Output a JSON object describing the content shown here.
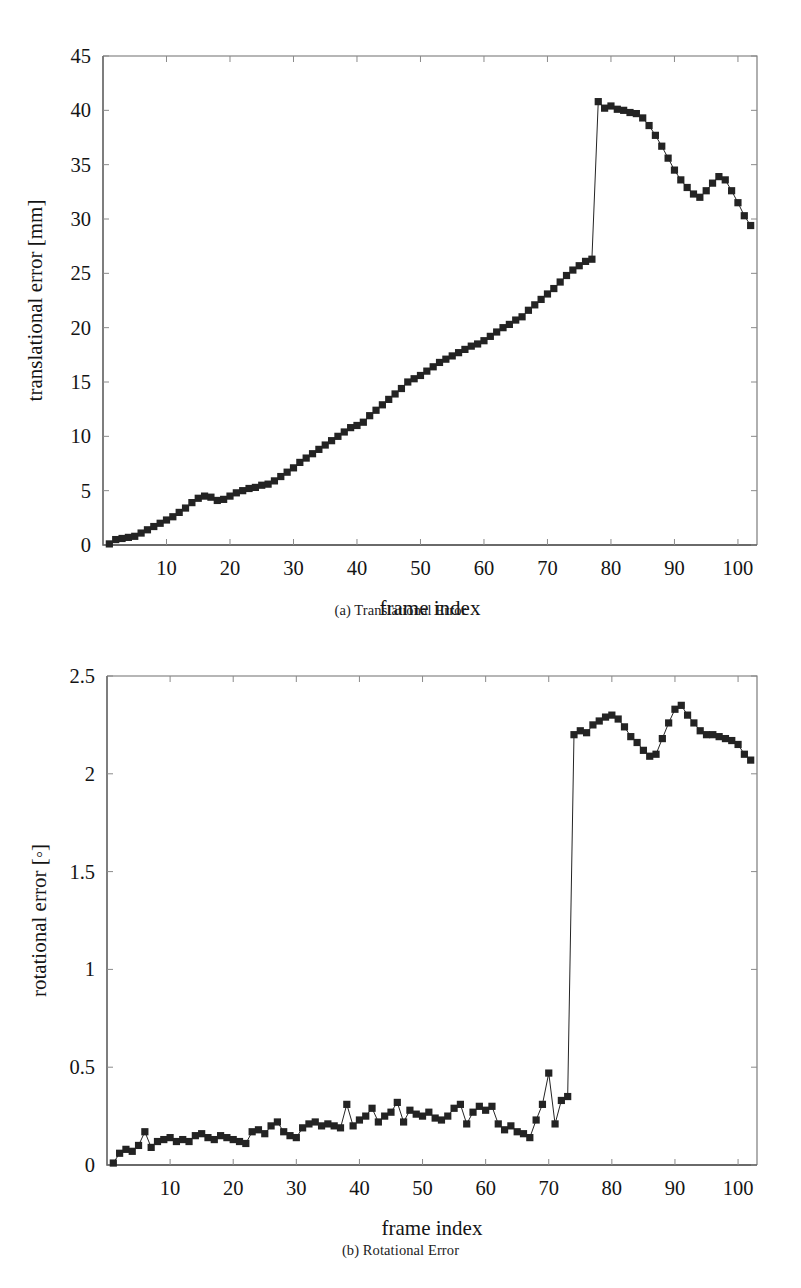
{
  "figure": {
    "panels": [
      {
        "id": "a",
        "caption": "(a) Translational Error"
      },
      {
        "id": "b",
        "caption": "(b) Rotational Error"
      }
    ]
  },
  "chart_data": [
    {
      "type": "line",
      "panel": "a",
      "title": "(a) Translational Error",
      "xlabel": "frame index",
      "ylabel": "translational error [mm]",
      "xlim": [
        0,
        103
      ],
      "ylim": [
        0,
        45
      ],
      "xticks": [
        10,
        20,
        30,
        40,
        50,
        60,
        70,
        80,
        90,
        100
      ],
      "xtick_labels": [
        "10",
        "20",
        "30",
        "40",
        "50",
        "60",
        "70",
        "80",
        "90",
        "100"
      ],
      "yticks": [
        0,
        5,
        10,
        15,
        20,
        25,
        30,
        35,
        40,
        45
      ],
      "ytick_labels": [
        "0",
        "5",
        "10",
        "15",
        "20",
        "25",
        "30",
        "35",
        "40",
        "45"
      ],
      "grid": false,
      "legend": "none",
      "marker": "square",
      "x": [
        1,
        2,
        3,
        4,
        5,
        6,
        7,
        8,
        9,
        10,
        11,
        12,
        13,
        14,
        15,
        16,
        17,
        18,
        19,
        20,
        21,
        22,
        23,
        24,
        25,
        26,
        27,
        28,
        29,
        30,
        31,
        32,
        33,
        34,
        35,
        36,
        37,
        38,
        39,
        40,
        41,
        42,
        43,
        44,
        45,
        46,
        47,
        48,
        49,
        50,
        51,
        52,
        53,
        54,
        55,
        56,
        57,
        58,
        59,
        60,
        61,
        62,
        63,
        64,
        65,
        66,
        67,
        68,
        69,
        70,
        71,
        72,
        73,
        74,
        75,
        76,
        77,
        78,
        79,
        80,
        81,
        82,
        83,
        84,
        85,
        86,
        87,
        88,
        89,
        90,
        91,
        92,
        93,
        94,
        95,
        96,
        97,
        98,
        99,
        100,
        101,
        102
      ],
      "values": [
        0.1,
        0.5,
        0.6,
        0.7,
        0.8,
        1.1,
        1.4,
        1.7,
        2.0,
        2.3,
        2.6,
        3.0,
        3.4,
        3.9,
        4.3,
        4.5,
        4.4,
        4.1,
        4.2,
        4.5,
        4.8,
        5.0,
        5.2,
        5.3,
        5.5,
        5.6,
        5.9,
        6.3,
        6.7,
        7.1,
        7.6,
        8.0,
        8.4,
        8.8,
        9.2,
        9.6,
        10.0,
        10.4,
        10.8,
        11.0,
        11.3,
        11.9,
        12.4,
        12.9,
        13.4,
        13.9,
        14.4,
        15.0,
        15.3,
        15.6,
        16.0,
        16.4,
        16.8,
        17.1,
        17.4,
        17.7,
        18.0,
        18.3,
        18.5,
        18.8,
        19.2,
        19.6,
        20.0,
        20.3,
        20.7,
        21.0,
        21.6,
        22.1,
        22.6,
        23.1,
        23.6,
        24.2,
        24.8,
        25.3,
        25.7,
        26.1,
        26.3,
        40.8,
        40.2,
        40.4,
        40.1,
        40.0,
        39.8,
        39.7,
        39.3,
        38.6,
        37.7,
        36.7,
        35.6,
        34.5,
        33.6,
        32.9,
        32.3,
        32.0,
        32.6,
        33.3,
        33.9,
        33.6,
        32.6,
        31.5,
        30.3,
        29.4
      ],
      "jump": {
        "from_index": 73,
        "to_index": 74,
        "from_value": 26.3,
        "to_value": 40.8
      },
      "tail_x": [
        97,
        98,
        99,
        100,
        101,
        102
      ],
      "tail_values": [
        29.4,
        29.2,
        28.6,
        28.1,
        27.4,
        26.6
      ]
    },
    {
      "type": "line",
      "panel": "b",
      "title": "(b) Rotational Error",
      "xlabel": "frame index",
      "ylabel": "rotational error [◦]",
      "xlim": [
        0,
        103
      ],
      "ylim": [
        0,
        2.5
      ],
      "xticks": [
        10,
        20,
        30,
        40,
        50,
        60,
        70,
        80,
        90,
        100
      ],
      "xtick_labels": [
        "10",
        "20",
        "30",
        "40",
        "50",
        "60",
        "70",
        "80",
        "90",
        "100"
      ],
      "yticks": [
        0,
        0.5,
        1,
        1.5,
        2,
        2.5
      ],
      "ytick_labels": [
        "0",
        "0.5",
        "1",
        "1.5",
        "2",
        "2.5"
      ],
      "grid": false,
      "legend": "none",
      "marker": "square",
      "x": [
        1,
        2,
        3,
        4,
        5,
        6,
        7,
        8,
        9,
        10,
        11,
        12,
        13,
        14,
        15,
        16,
        17,
        18,
        19,
        20,
        21,
        22,
        23,
        24,
        25,
        26,
        27,
        28,
        29,
        30,
        31,
        32,
        33,
        34,
        35,
        36,
        37,
        38,
        39,
        40,
        41,
        42,
        43,
        44,
        45,
        46,
        47,
        48,
        49,
        50,
        51,
        52,
        53,
        54,
        55,
        56,
        57,
        58,
        59,
        60,
        61,
        62,
        63,
        64,
        65,
        66,
        67,
        68,
        69,
        70,
        71,
        72,
        73,
        74,
        75,
        76,
        77,
        78,
        79,
        80,
        81,
        82,
        83,
        84,
        85,
        86,
        87,
        88,
        89,
        90,
        91,
        92,
        93,
        94,
        95,
        96,
        97,
        98,
        99,
        100,
        101,
        102
      ],
      "values": [
        0.01,
        0.06,
        0.08,
        0.07,
        0.1,
        0.17,
        0.09,
        0.12,
        0.13,
        0.14,
        0.12,
        0.13,
        0.12,
        0.15,
        0.16,
        0.14,
        0.13,
        0.15,
        0.14,
        0.13,
        0.12,
        0.11,
        0.17,
        0.18,
        0.16,
        0.2,
        0.22,
        0.17,
        0.15,
        0.14,
        0.19,
        0.21,
        0.22,
        0.2,
        0.21,
        0.2,
        0.19,
        0.31,
        0.2,
        0.23,
        0.25,
        0.29,
        0.22,
        0.25,
        0.27,
        0.32,
        0.22,
        0.28,
        0.26,
        0.25,
        0.27,
        0.24,
        0.23,
        0.25,
        0.29,
        0.31,
        0.21,
        0.27,
        0.3,
        0.28,
        0.3,
        0.21,
        0.18,
        0.2,
        0.17,
        0.16,
        0.14,
        0.23,
        0.31,
        0.47,
        0.21,
        0.33,
        0.35,
        2.2,
        2.22,
        2.21,
        2.25,
        2.27,
        2.29,
        2.3,
        2.28,
        2.24,
        2.19,
        2.16,
        2.12,
        2.09,
        2.1,
        2.18,
        2.26,
        2.33,
        2.35,
        2.3,
        2.26,
        2.22,
        2.2,
        2.2,
        2.19,
        2.18,
        2.17,
        2.15,
        2.1,
        2.07
      ],
      "jump": {
        "from_index": 73,
        "to_index": 74,
        "from_value": 0.35,
        "to_value": 2.2
      }
    }
  ],
  "colors": {
    "marker": "#232323",
    "line": "#242424",
    "frame": "#6f6f6f",
    "text": "#141414",
    "background": "#ffffff"
  }
}
